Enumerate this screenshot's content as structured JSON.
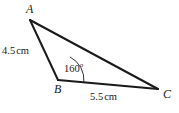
{
  "figure": {
    "type": "triangle-diagram",
    "background_color": "#ffffff",
    "stroke_color": "#1a1a1a",
    "vertices": {
      "A": {
        "label": "A",
        "x": 30,
        "y": 20
      },
      "B": {
        "label": "B",
        "x": 58,
        "y": 80
      },
      "C": {
        "label": "C",
        "x": 158,
        "y": 89
      }
    },
    "sides": {
      "AB": {
        "label": "4.5",
        "unit": "cm",
        "from": "A",
        "to": "B"
      },
      "BC": {
        "label": "5.5",
        "unit": "cm",
        "from": "B",
        "to": "C"
      },
      "AC": {
        "label": "",
        "unit": "",
        "from": "A",
        "to": "C"
      }
    },
    "angle": {
      "at_vertex": "B",
      "value": "160",
      "degree_symbol": "o",
      "arc_radius": 26
    }
  }
}
